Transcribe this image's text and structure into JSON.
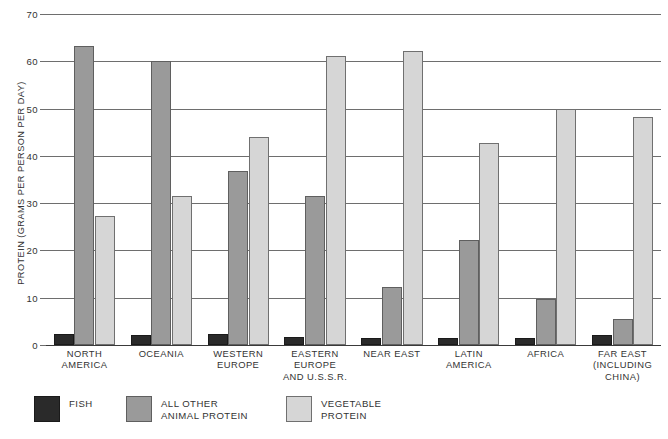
{
  "chart_data": {
    "type": "bar",
    "title": "",
    "xlabel": "",
    "ylabel": "PROTEIN (GRAMS PER PERSON PER DAY)",
    "ylim": [
      0,
      70
    ],
    "yticks": [
      0,
      10,
      20,
      30,
      40,
      50,
      60,
      70
    ],
    "ytick_labels": [
      "0",
      "10",
      "20",
      "30",
      "40",
      "50",
      "60",
      "70"
    ],
    "grid": true,
    "legend_position": "bottom-left",
    "categories": [
      "NORTH\nAMERICA",
      "OCEANIA",
      "WESTERN\nEUROPE",
      "EASTERN\nEUROPE\nAND U.S.S.R.",
      "NEAR EAST",
      "LATIN\nAMERICA",
      "AFRICA",
      "FAR EAST\n(INCLUDING\nCHINA)"
    ],
    "series": [
      {
        "name": "FISH",
        "color": "#2a2a2a",
        "values": [
          2.3,
          2.2,
          2.4,
          1.7,
          1.5,
          1.5,
          1.4,
          2.1
        ]
      },
      {
        "name": "ALL OTHER\nANIMAL PROTEIN",
        "color": "#9a9a9a",
        "values": [
          63.3,
          60.0,
          36.7,
          31.5,
          12.3,
          22.3,
          9.8,
          5.5
        ]
      },
      {
        "name": "VEGETABLE\nPROTEIN",
        "color": "#d6d6d6",
        "values": [
          27.3,
          31.5,
          44.0,
          61.2,
          62.2,
          42.7,
          50.0,
          48.2
        ]
      }
    ]
  },
  "legend": {
    "items": [
      {
        "label": "FISH",
        "swatch": "fish"
      },
      {
        "label": "ALL OTHER\nANIMAL PROTEIN",
        "swatch": "animal"
      },
      {
        "label": "VEGETABLE\nPROTEIN",
        "swatch": "vegetable"
      }
    ]
  },
  "colors": {
    "fish": "#2a2a2a",
    "animal_protein": "#9a9a9a",
    "vegetable_protein": "#d6d6d6",
    "gridline": "#6e6e6e",
    "text": "#333333",
    "background": "#ffffff"
  }
}
